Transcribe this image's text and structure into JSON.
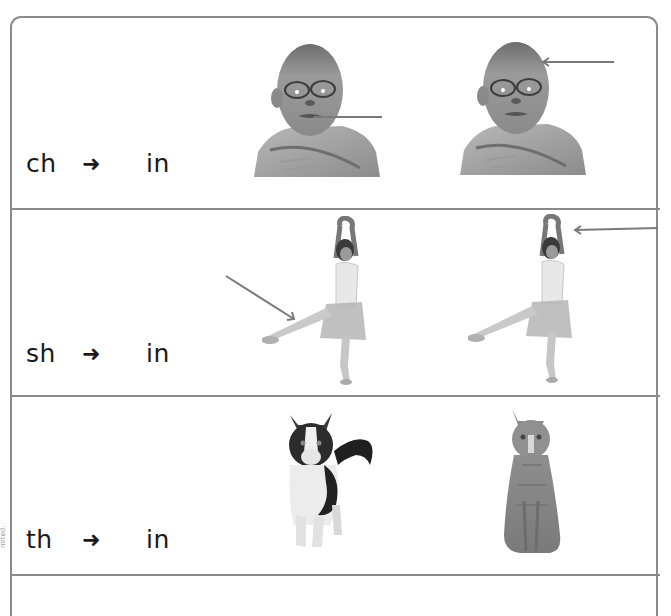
{
  "worksheet": {
    "rows": [
      {
        "sound": "ch",
        "arrow_glyph": "➜",
        "target": "in",
        "pictures": [
          {
            "subject": "boy-face",
            "pointer": "line to chin",
            "pointer_color": "#7a7a7a"
          },
          {
            "subject": "boy-face",
            "pointer": "left arrow to head",
            "pointer_color": "#7a7a7a"
          }
        ]
      },
      {
        "sound": "sh",
        "arrow_glyph": "➜",
        "target": "in",
        "pictures": [
          {
            "subject": "ballet-dancer",
            "pointer": "diagonal arrow to shin",
            "pointer_color": "#7a7a7a"
          },
          {
            "subject": "ballet-dancer",
            "pointer": "left arrow to raised arm",
            "pointer_color": "#7a7a7a"
          }
        ]
      },
      {
        "sound": "th",
        "arrow_glyph": "➜",
        "target": "in",
        "pictures": [
          {
            "subject": "calico-cat",
            "pointer": "none"
          },
          {
            "subject": "tabby-cat",
            "pointer": "none"
          }
        ]
      }
    ],
    "side_note": "mited."
  },
  "colors": {
    "border": "#8a8a8a",
    "pointer": "#7a7a7a",
    "text": "#1a1a1a"
  }
}
